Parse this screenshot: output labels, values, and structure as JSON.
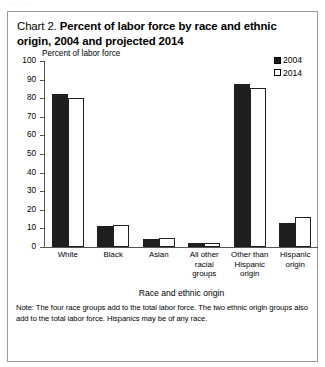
{
  "page": {
    "top_bleed_text": "·  ·        ·            ·        ·"
  },
  "figure": {
    "title_number": "Chart 2.",
    "title_main": "Percent of labor force by race and ethnic origin, 2004 and projected 2014",
    "note": "Note: The four race groups add to the total labor force.  The two ethnic origin groups also add to the total labor force.  Hispanics may be of any race."
  },
  "legend": {
    "items": [
      {
        "label": "2004",
        "style": "filled",
        "color": "#1f1f1f"
      },
      {
        "label": "2014",
        "style": "hollow",
        "color": "#ffffff"
      }
    ]
  },
  "axes": {
    "y_axis_label": "Percent of labor force",
    "x_axis_label": "Race and ethnic origin",
    "y_ticks": [
      "100",
      "90",
      "80",
      "70",
      "60",
      "50",
      "40",
      "30",
      "20",
      "10",
      "0"
    ]
  },
  "chart_data": {
    "type": "bar",
    "title": "Chart 2. Percent of labor force by race and ethnic origin, 2004 and projected 2014",
    "xlabel": "Race and ethnic origin",
    "ylabel": "Percent of labor force",
    "ylim": [
      0,
      100
    ],
    "ytick_step": 10,
    "grid": false,
    "legend_position": "top-right",
    "categories": [
      "White",
      "Black",
      "Asian",
      "All other racial groups",
      "Other than Hispanic origin",
      "Hispanic origin"
    ],
    "category_label_lines": [
      [
        "White"
      ],
      [
        "Black"
      ],
      [
        "Asian"
      ],
      [
        "All other",
        "racial",
        "groups"
      ],
      [
        "Other than",
        "Hispanic",
        "origin"
      ],
      [
        "Hispanic",
        "origin"
      ]
    ],
    "series": [
      {
        "name": "2004",
        "color": "#1f1f1f",
        "values": [
          82.0,
          11.5,
          4.3,
          1.9,
          87.5,
          13.0
        ]
      },
      {
        "name": "2014",
        "color": "#ffffff",
        "values": [
          80.0,
          11.8,
          5.1,
          2.2,
          85.5,
          15.9
        ]
      }
    ],
    "note": "Note: The four race groups add to the total labor force.  The two ethnic origin groups also add to the total labor force.  Hispanics may be of any race."
  }
}
